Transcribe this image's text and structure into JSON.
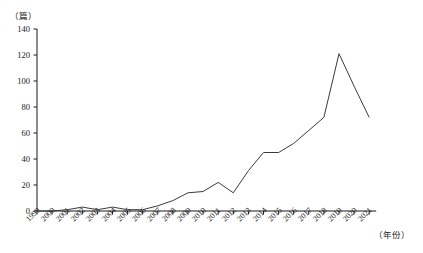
{
  "chart_data": {
    "type": "line",
    "title": "",
    "xlabel": "（年份）",
    "ylabel": "（篇）",
    "x": [
      1999,
      2000,
      2001,
      2002,
      2003,
      2004,
      2005,
      2006,
      2007,
      2008,
      2009,
      2010,
      2011,
      2012,
      2013,
      2014,
      2015,
      2016,
      2017,
      2018,
      2019,
      2020,
      2021
    ],
    "categories": [
      "1999",
      "2000",
      "2001",
      "2002",
      "2003",
      "2004",
      "2005",
      "2006",
      "2007",
      "2008",
      "2009",
      "2010",
      "2011",
      "2012",
      "2013",
      "2014",
      "2015",
      "2016",
      "2017",
      "2018",
      "2019",
      "2020",
      "2021"
    ],
    "values": [
      0,
      0,
      1,
      3,
      1,
      3,
      1,
      1,
      4,
      8,
      14,
      15,
      22,
      14,
      31,
      45,
      45,
      52,
      62,
      72,
      121,
      96,
      72
    ],
    "ylim": [
      0,
      140
    ],
    "yticks": [
      0,
      20,
      40,
      60,
      80,
      100,
      120,
      140
    ],
    "ytick_labels": [
      "0",
      "20",
      "40",
      "60",
      "80",
      "100",
      "120",
      "140"
    ],
    "xlim": [
      1999,
      2021
    ],
    "grid": false,
    "legend": false,
    "line_color": "#3a3a3a",
    "axis_color": "#1a1a1a"
  },
  "axes": {
    "y_unit_label": "（篇）",
    "x_unit_label": "（年份）"
  }
}
